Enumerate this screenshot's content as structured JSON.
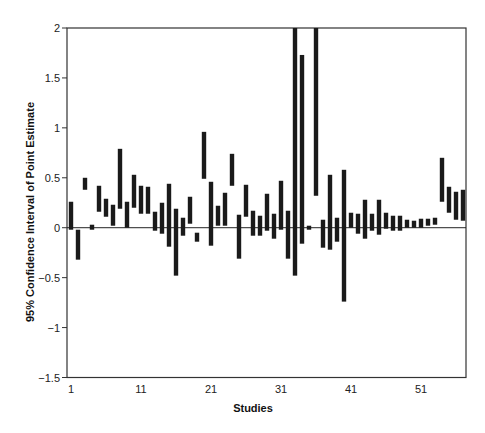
{
  "chart_data": {
    "type": "bar",
    "subtype": "floating-range (confidence interval bars)",
    "title": "",
    "xlabel": "Studies",
    "ylabel": "95% Confidence Interval of Point Estimate",
    "ylim": [
      -1.5,
      2
    ],
    "xlim": [
      1,
      57
    ],
    "yticks": [
      2,
      1.5,
      1,
      0.5,
      0,
      -0.5,
      -1,
      -1.5
    ],
    "ytick_labels": [
      "2",
      "1.5",
      "1",
      "0.5",
      "0",
      "−0.5",
      "−1",
      "−1.5"
    ],
    "xticks": [
      1,
      11,
      21,
      31,
      41,
      51
    ],
    "xtick_labels": [
      "1",
      "11",
      "21",
      "31",
      "41",
      "51"
    ],
    "grid": false,
    "reference_line": 0,
    "legend": null,
    "bar_color": "#1a1a1a",
    "series": [
      {
        "name": "95% CI",
        "studies": [
          1,
          2,
          3,
          4,
          5,
          6,
          7,
          8,
          9,
          10,
          11,
          12,
          13,
          14,
          15,
          16,
          17,
          18,
          19,
          20,
          21,
          22,
          23,
          24,
          25,
          26,
          27,
          28,
          29,
          30,
          31,
          32,
          33,
          34,
          35,
          36,
          37,
          38,
          39,
          40,
          41,
          42,
          43,
          44,
          45,
          46,
          47,
          48,
          49,
          50,
          51,
          52,
          53,
          54,
          55,
          56,
          57
        ],
        "lower": [
          -0.02,
          -0.32,
          0.38,
          -0.02,
          0.16,
          0.11,
          0.02,
          0.19,
          0.0,
          0.2,
          0.14,
          0.14,
          -0.03,
          -0.06,
          -0.19,
          -0.48,
          -0.08,
          0.04,
          -0.14,
          0.49,
          -0.18,
          0.02,
          0.02,
          0.42,
          -0.31,
          0.11,
          -0.08,
          -0.08,
          -0.03,
          -0.11,
          -0.02,
          -0.31,
          -0.48,
          -0.16,
          -0.02,
          0.32,
          -0.2,
          -0.22,
          -0.14,
          -0.74,
          0.0,
          -0.06,
          -0.11,
          -0.03,
          -0.07,
          -0.01,
          -0.03,
          -0.03,
          0.0,
          0.0,
          0.0,
          0.02,
          0.03,
          0.26,
          0.15,
          0.08,
          0.07
        ],
        "upper": [
          0.26,
          -0.02,
          0.5,
          0.03,
          0.42,
          0.29,
          0.23,
          0.79,
          0.26,
          0.53,
          0.42,
          0.41,
          0.16,
          0.25,
          0.44,
          0.19,
          0.1,
          0.31,
          -0.05,
          0.96,
          0.46,
          0.22,
          0.35,
          0.74,
          0.13,
          0.43,
          0.17,
          0.12,
          0.34,
          0.14,
          0.47,
          0.17,
          2.0,
          1.73,
          0.02,
          2.0,
          0.08,
          0.53,
          0.1,
          0.58,
          0.15,
          0.14,
          0.28,
          0.14,
          0.28,
          0.15,
          0.12,
          0.12,
          0.08,
          0.07,
          0.09,
          0.09,
          0.1,
          0.7,
          0.41,
          0.36,
          0.38
        ]
      }
    ],
    "annotations": []
  }
}
